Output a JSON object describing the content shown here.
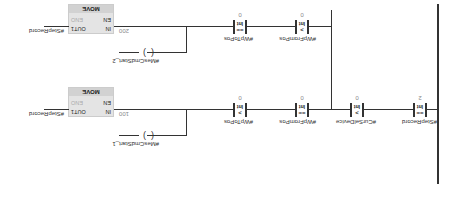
{
  "network": {
    "series_contacts": [
      {
        "variable": "#StepRecord",
        "operator": "==",
        "type": "Int",
        "value": "2"
      },
      {
        "variable": "#CurSelDevice",
        "operator": ">",
        "type": "Int",
        "value": "0"
      }
    ],
    "branches": [
      {
        "contacts": [
          {
            "variable": "#WpFromPos",
            "operator": "==",
            "type": "Int",
            "value": "0"
          },
          {
            "variable": "#WpToPos",
            "operator": ">",
            "type": "Int",
            "value": "0"
          }
        ],
        "move": {
          "title": "MOVE",
          "en": "EN",
          "eno": "ENO",
          "in_label": "IN",
          "in_value": "100",
          "out_label": "OUT1",
          "out_value": "#StepRecord"
        },
        "coil": {
          "variable": "#MesCmdStart_1"
        }
      },
      {
        "contacts": [
          {
            "variable": "#WpFromPos",
            "operator": ">",
            "type": "Int",
            "value": "0"
          },
          {
            "variable": "#WpToPos",
            "operator": "==",
            "type": "Int",
            "value": "0"
          }
        ],
        "move": {
          "title": "MOVE",
          "en": "EN",
          "eno": "ENO",
          "in_label": "IN",
          "in_value": "200",
          "out_label": "OUT1",
          "out_value": "#StepRecord"
        },
        "coil": {
          "variable": "#MesCmdStart_2"
        }
      }
    ]
  }
}
